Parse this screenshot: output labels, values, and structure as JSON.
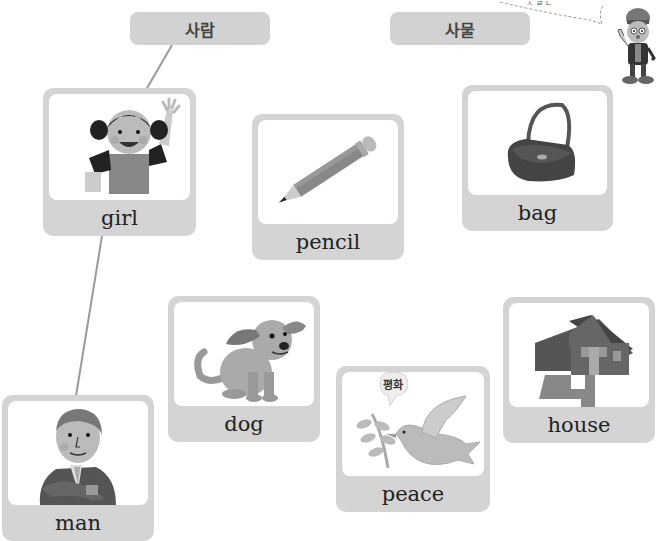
{
  "categories": {
    "person": {
      "label": "사람"
    },
    "thing": {
      "label": "사물"
    }
  },
  "cards": [
    {
      "id": "girl",
      "label": "girl",
      "icon": "girl-waving-icon"
    },
    {
      "id": "pencil",
      "label": "pencil",
      "icon": "pencil-icon"
    },
    {
      "id": "bag",
      "label": "bag",
      "icon": "handbag-icon"
    },
    {
      "id": "dog",
      "label": "dog",
      "icon": "dog-icon"
    },
    {
      "id": "peace",
      "label": "peace",
      "icon": "dove-icon",
      "caption": "평화"
    },
    {
      "id": "house",
      "label": "house",
      "icon": "house-icon"
    },
    {
      "id": "man",
      "label": "man",
      "icon": "man-arms-crossed-icon"
    }
  ],
  "connections": [
    {
      "from": "사람",
      "to": "girl"
    },
    {
      "from": "girl",
      "to": "man"
    }
  ],
  "mascot": {
    "icon": "mascot-character-icon"
  },
  "colors": {
    "card_bg": "#d4d4d4",
    "category_bg": "#d2d2d2",
    "line": "#9a9a9a",
    "text": "#222222"
  }
}
